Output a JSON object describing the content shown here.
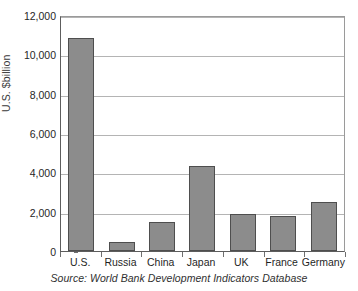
{
  "chart_data": {
    "type": "bar",
    "title": "",
    "subtitle": "",
    "xlabel": "",
    "ylabel": "U.S. $billion",
    "categories": [
      "U.S.",
      "Russia",
      "China",
      "Japan",
      "UK",
      "France",
      "Germany"
    ],
    "values": [
      10850,
      450,
      1450,
      4300,
      1900,
      1800,
      2500
    ],
    "series": [
      {
        "name": "GDP",
        "values": [
          10850,
          450,
          1450,
          4300,
          1900,
          1800,
          2500
        ]
      }
    ],
    "ylim": [
      0,
      12000
    ],
    "ytick_values": [
      0,
      2000,
      4000,
      6000,
      8000,
      10000,
      12000
    ],
    "ytick_labels": [
      "0",
      "2,000",
      "4,000",
      "6,000",
      "8,000",
      "10,000",
      "12,000"
    ],
    "grid": true,
    "grid_axis": "y",
    "legend": false,
    "legend_position": "none",
    "bar_color": "#8c8c8c",
    "bar_edge_color": "#4e4e4e",
    "gridline_color": "#b4b4b4",
    "axis_color": "#5d5d5d",
    "background_color": "#ffffff",
    "annotations": []
  },
  "caption": {
    "source_text": "Source: World Bank Development Indicators Database"
  }
}
